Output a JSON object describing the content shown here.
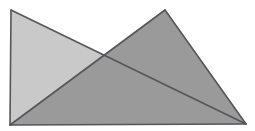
{
  "figure": {
    "width": 255,
    "height": 131,
    "background_color": "#ffffff",
    "stroke_color": "#55555a",
    "stroke_width": 1.6,
    "shapes": [
      {
        "name": "light-triangle",
        "label": "Light gray triangle",
        "fill": "#c9c9c9",
        "points": [
          [
            11,
            10
          ],
          [
            10,
            125
          ],
          [
            246,
            124
          ]
        ],
        "apex": [
          11,
          10
        ],
        "bottom_left": [
          10,
          125
        ],
        "bottom_right": [
          246,
          124
        ]
      },
      {
        "name": "dark-triangle",
        "label": "Medium gray triangle",
        "fill": "#9a9a9a",
        "points": [
          [
            165,
            10
          ],
          [
            10,
            125
          ],
          [
            246,
            124
          ]
        ],
        "apex": [
          165,
          10
        ],
        "bottom_left": [
          10,
          125
        ],
        "bottom_right": [
          246,
          124
        ]
      },
      {
        "name": "overlap-region",
        "label": "Overlap of both triangles",
        "fill": "#9a9a9a",
        "points": [
          [
            165,
            10
          ],
          [
            104,
            56
          ],
          [
            246,
            124
          ]
        ],
        "crossing_point": [
          104,
          56
        ]
      }
    ],
    "edges": [
      {
        "name": "light-left-edge",
        "from": [
          11,
          10
        ],
        "to": [
          10,
          125
        ]
      },
      {
        "name": "light-hypotenuse",
        "from": [
          11,
          10
        ],
        "to": [
          246,
          124
        ]
      },
      {
        "name": "shared-base",
        "from": [
          10,
          125
        ],
        "to": [
          246,
          124
        ]
      },
      {
        "name": "dark-left-edge",
        "from": [
          165,
          10
        ],
        "to": [
          10,
          125
        ]
      },
      {
        "name": "dark-right-edge",
        "from": [
          165,
          10
        ],
        "to": [
          246,
          124
        ]
      }
    ]
  }
}
